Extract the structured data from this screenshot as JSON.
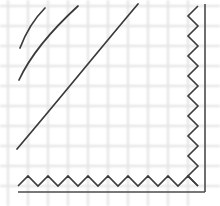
{
  "figure": {
    "width": 220,
    "height": 206,
    "background_color": "#ffffff"
  },
  "chart_data": {
    "type": "line",
    "title": "",
    "subtitle": "",
    "xlabel": "",
    "ylabel": "",
    "xlim": [
      0,
      220
    ],
    "ylim": [
      206,
      0
    ],
    "grid": true,
    "legend": false,
    "legend_position": "none",
    "tick_labels": {
      "x": [],
      "y": []
    },
    "annotations": [],
    "grid_spec": {
      "spacing_px": 20,
      "color": "#e3e3e3",
      "stroke_width": 2.2,
      "x_positions": [
        8,
        28,
        48,
        68,
        88,
        108,
        128,
        148,
        168,
        188
      ],
      "y_positions": [
        6,
        26,
        46,
        66,
        86,
        106,
        126,
        146,
        166,
        186
      ]
    },
    "series": [
      {
        "name": "arc-inner",
        "color": "#3a3a3a",
        "stroke_width": 1.7,
        "path": "M 45,8 C 35,18 26,32 20,48",
        "start_point": [
          45,
          8
        ],
        "end_point": [
          20,
          48
        ]
      },
      {
        "name": "arc-middle",
        "color": "#3a3a3a",
        "stroke_width": 1.7,
        "path": "M 78,6 C 54,28 32,52 19,80",
        "start_point": [
          78,
          6
        ],
        "end_point": [
          19,
          80
        ]
      },
      {
        "name": "arc-outer",
        "color": "#3a3a3a",
        "stroke_width": 1.7,
        "path": "M 138,4 C 104,44 62,96 17,149",
        "start_point": [
          138,
          4
        ],
        "end_point": [
          17,
          149
        ]
      }
    ],
    "boundaries": [
      {
        "name": "bottom-zigzag",
        "orientation": "horizontal",
        "color": "#3c3c3c",
        "period_px": 20,
        "amplitude_px": 10,
        "baseline_y": 186,
        "peak_y": 176,
        "x_start": 18,
        "x_end": 198
      },
      {
        "name": "right-zigzag",
        "orientation": "vertical",
        "color": "#3c3c3c",
        "period_px": 20,
        "amplitude_px": 10,
        "baseline_x": 198,
        "peak_x": 188,
        "y_start": 6,
        "y_end": 186
      }
    ],
    "frame_edges": [
      {
        "name": "bottom-frame-line",
        "color": "#4a4a4a",
        "from": [
          18,
          192
        ],
        "to": [
          205,
          192
        ]
      },
      {
        "name": "right-frame-line",
        "color": "#4a4a4a",
        "from": [
          205,
          4
        ],
        "to": [
          205,
          192
        ]
      }
    ]
  }
}
